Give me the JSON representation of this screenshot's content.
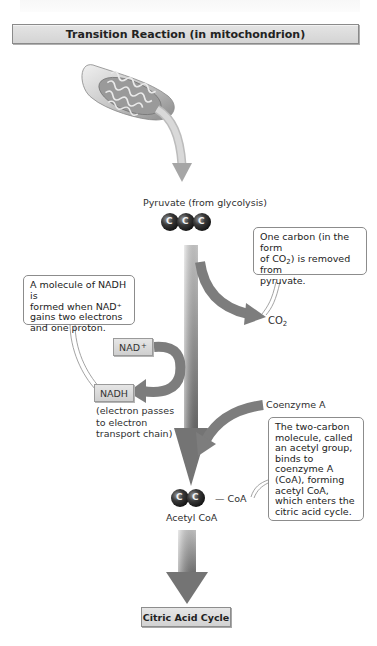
{
  "header": {
    "title": "Transition Reaction (in mitochondrion)"
  },
  "organelle": {
    "icon": "mitochondrion-icon"
  },
  "pyruvate": {
    "label": "Pyruvate (from glycolysis)",
    "carbons": [
      "C",
      "C",
      "C"
    ]
  },
  "co2": {
    "label": "CO",
    "subscript": "2",
    "callout": {
      "line1": "One carbon (in the form",
      "line2_pre": "of CO",
      "line2_sub": "2",
      "line2_post": ") is removed from",
      "line3": "pyruvate."
    }
  },
  "nad": {
    "input_label": "NAD",
    "input_sup": "+",
    "output_label": "NADH",
    "output_note": [
      "(electron passes",
      "to electron",
      "transport chain)"
    ],
    "callout": [
      "A molecule of NADH is",
      "formed when NAD⁺",
      "gains two electrons",
      "and one proton."
    ]
  },
  "coenzyme": {
    "label": "Coenzyme A",
    "callout": [
      "The two-carbon",
      "molecule, called",
      "an acetyl group,",
      "binds to",
      "coenzyme A",
      "(CoA), forming",
      "acetyl CoA,",
      "which enters the",
      "citric acid cycle."
    ]
  },
  "acetyl": {
    "label": "Acetyl CoA",
    "carbons": [
      "C",
      "C"
    ],
    "coa_tag": "— CoA"
  },
  "output": {
    "label": "Citric Acid Cycle"
  },
  "colors": {
    "arrow_dark": "#7a7a7a",
    "arrow_light": "#d8d8d8",
    "carbon_dark": "#2b2b2b",
    "callout_border": "#8c8c8c"
  }
}
